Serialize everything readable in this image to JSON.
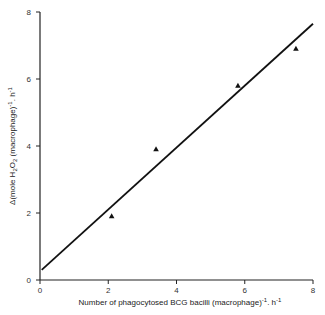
{
  "chart_data": {
    "type": "scatter",
    "title": "",
    "xlabel": "Number of phagocytosed BCG bacilli (macrophage)-1. h-1",
    "ylabel": "Δ(mole H2O2 (macrophage)-1. h-1",
    "xlim": [
      0,
      8
    ],
    "ylim": [
      0,
      8
    ],
    "x_ticks": [
      0,
      2,
      4,
      6,
      8
    ],
    "y_ticks": [
      0,
      2,
      4,
      6,
      8
    ],
    "grid": false,
    "legend": null,
    "series": [
      {
        "name": "measured",
        "marker": "triangle",
        "x": [
          2.1,
          3.4,
          5.8,
          7.5
        ],
        "y": [
          1.9,
          3.9,
          5.8,
          6.9
        ]
      }
    ],
    "fit_line": {
      "name": "regression line",
      "x": [
        0.05,
        8.0
      ],
      "y": [
        0.3,
        7.65
      ],
      "slope": 0.92,
      "intercept": 0.28
    }
  },
  "axes": {
    "x_tick_labels": [
      "0",
      "2",
      "4",
      "6",
      "8"
    ],
    "y_tick_labels": [
      "0",
      "2",
      "4",
      "6",
      "8"
    ],
    "x_title": "Number of phagocytosed BCG bacilli (macrophage)",
    "x_title_sup1": "-1",
    "x_title_mid": ". h",
    "x_title_sup2": "-1",
    "y_title_prefix": "Δ(mole H",
    "y_title_sub1": "2",
    "y_title_o": "O",
    "y_title_sub2": "2",
    "y_title_mid": " (macrophage)",
    "y_title_sup1": "-1",
    "y_title_h": ". h",
    "y_title_sup2": "-1"
  }
}
